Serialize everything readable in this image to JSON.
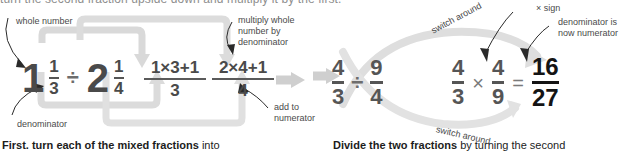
{
  "top_cropped_line": "turn the second fraction upside down and multiply it by the first.",
  "left_panel": {
    "labels": {
      "whole_number": "whole number",
      "multiply_whole": "multiply whole\nnumber by\ndenominator",
      "multiply_whole_l1": "multiply whole",
      "multiply_whole_l2": "number by",
      "multiply_whole_l3": "denominator",
      "denominator": "denominator",
      "add_to_l1": "add to",
      "add_to_l2": "numerator"
    },
    "expression": {
      "mixed1_whole": "1",
      "mixed1_num": "1",
      "mixed1_den": "3",
      "divide_sign": "÷",
      "mixed2_whole": "2",
      "mixed2_num": "1",
      "mixed2_den": "4",
      "work1_num": "1×3+1",
      "work1_den": "3",
      "work2_num": "2×4+1",
      "work2_den": "4"
    },
    "caption_bold": "First. turn each of the mixed fractions",
    "caption_rest": " into"
  },
  "right_panel": {
    "labels": {
      "switch_around_top": "switch around",
      "switch_around_bottom": "switch around",
      "times_sign": "× sign",
      "denominator_now_l1": "denominator is",
      "denominator_now_l2": "now numerator"
    },
    "expression": {
      "f1_num": "4",
      "f1_den": "3",
      "divide_sign": "÷",
      "f2_num": "9",
      "f2_den": "4",
      "f3_num": "4",
      "f3_den": "3",
      "times_sign": "×",
      "f4_num": "4",
      "f4_den": "9",
      "equals_sign": "=",
      "result_num": "16",
      "result_den": "27"
    },
    "caption_bold": "Divide the two fractions",
    "caption_rest": " by turning the second"
  },
  "colors": {
    "math_gray": "#4f4f4f",
    "arrow_gray": "#d4d4d4",
    "label_gray": "#4a4a4a",
    "result_black": "#141414"
  }
}
